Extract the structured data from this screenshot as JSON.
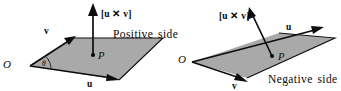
{
  "figure": {
    "caption_absent": true,
    "background_color": "#ffffff",
    "plane_fill_color": "#a9a9a9",
    "ink_color": "#0d0d0d",
    "panels": [
      {
        "id": "positive",
        "side_label": "Positive side",
        "cross_product_label": "[u ✕ v]",
        "origin_label": "O",
        "point_label": "P",
        "vector_u_label": "u",
        "vector_v_label": "v",
        "angle_label": "θ",
        "normal_direction": "up",
        "description": "Parallelogram spanned by u and v with normal vector pointing up out of the plane"
      },
      {
        "id": "negative",
        "side_label": "Negative side",
        "cross_product_label": "[u ✕ v]",
        "origin_label": "O",
        "point_label": "P",
        "vector_u_label": "u",
        "vector_v_label": "v",
        "angle_label": "",
        "normal_direction": "up-left",
        "description": "Parallelogram viewed from below with normal vector piercing the plane from point P"
      }
    ]
  }
}
